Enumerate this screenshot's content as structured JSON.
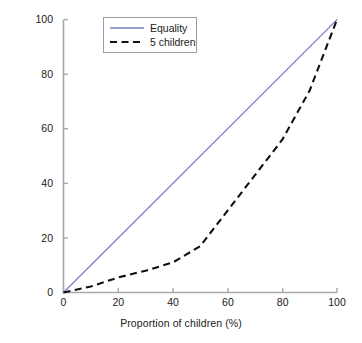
{
  "chart_data": {
    "type": "line",
    "title": "",
    "xlabel": "Proportion of children (%)",
    "ylabel": "Cumulative allowance (€)",
    "xlim": [
      0,
      100
    ],
    "ylim": [
      0,
      100
    ],
    "xticks": [
      "0",
      "20",
      "40",
      "60",
      "80",
      "100"
    ],
    "xtick_values": [
      0,
      20,
      40,
      60,
      80,
      100
    ],
    "yticks": [
      "0",
      "20",
      "40",
      "60",
      "80",
      "100"
    ],
    "ytick_values": [
      0,
      20,
      40,
      60,
      80,
      100
    ],
    "grid": false,
    "legend_position": "upper left",
    "series": [
      {
        "name": "Equality",
        "style": "solid",
        "color": "#7b7fc4",
        "x": [
          0,
          100
        ],
        "values": [
          0,
          100
        ]
      },
      {
        "name": "5 children",
        "style": "dashed",
        "color": "#111111",
        "x": [
          0,
          10,
          20,
          30,
          40,
          50,
          60,
          70,
          80,
          90,
          100
        ],
        "values": [
          0,
          2.2,
          5.5,
          8.0,
          11.0,
          17.0,
          30.0,
          43.0,
          56.0,
          74.0,
          100.0
        ]
      }
    ]
  },
  "legend": {
    "entries": [
      {
        "label": "Equality"
      },
      {
        "label": "5 children"
      }
    ]
  },
  "colors": {
    "equality_line": "#7b7fc4",
    "children_line": "#111111",
    "axis": "#a8a8a8",
    "legend_border": "#9a9aa8",
    "text": "#1a1a1a",
    "background": "#ffffff"
  }
}
